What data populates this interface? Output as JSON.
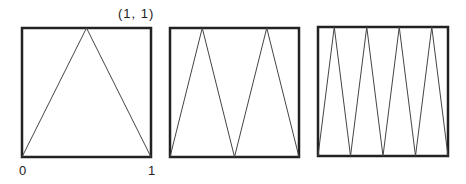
{
  "diagram": {
    "panels": [
      {
        "id": "panel-1",
        "teeth": 1,
        "box": [
          22,
          28,
          151,
          157
        ]
      },
      {
        "id": "panel-2",
        "teeth": 2,
        "box": [
          170,
          28,
          299,
          157
        ]
      },
      {
        "id": "panel-3",
        "teeth": 4,
        "box": [
          318,
          27,
          448,
          156
        ]
      }
    ],
    "labels": {
      "corner": "(1, 1)",
      "origin": "0",
      "one": "1"
    },
    "colors": {
      "frame": "#222222",
      "line": "#444444",
      "background": "#ffffff"
    }
  }
}
